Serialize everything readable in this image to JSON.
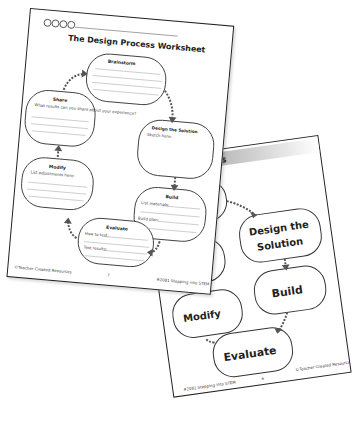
{
  "front_sheet": {
    "logo_text": "♻♻♻♻",
    "title": "The Design Process Worksheet",
    "steps": [
      {
        "label": "Brainstorm",
        "prompts": []
      },
      {
        "label": "Design the Solution",
        "prompts": [
          "Sketch here:"
        ]
      },
      {
        "label": "Build",
        "prompts": [
          "List materials:",
          "Build plan:"
        ]
      },
      {
        "label": "Evaluate",
        "prompts": [
          "How to test:",
          "Test results:"
        ]
      },
      {
        "label": "Modify",
        "prompts": [
          "List adjustments here:"
        ]
      },
      {
        "label": "Share",
        "prompts": [
          "What results can you share about your experience?"
        ]
      }
    ],
    "footer_left": "©Teacher Created Resources",
    "footer_right": "#2081 Stepping into STEM",
    "page_number": "7"
  },
  "back_sheet": {
    "header": "sign Process",
    "steps": [
      "Brainstorm",
      "Design the Solution",
      "Build",
      "Evaluate",
      "Modify",
      "Share"
    ],
    "visible_labels": {
      "brainstorm": "instorm",
      "design_line1": "Design the",
      "design_line2": "Solution",
      "build": "Build",
      "evaluate": "Evaluate",
      "modify": "Modify",
      "share": "Share"
    },
    "footer_left": "#2081 Stepping into STEM",
    "footer_right": "©Teacher Created Resources",
    "page_number": "6"
  }
}
